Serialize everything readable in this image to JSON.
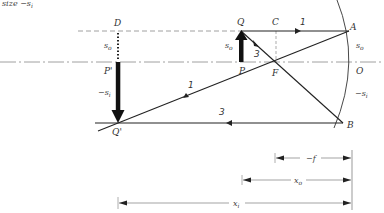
{
  "caption_fragment": "size  −s",
  "caption_subscript": "i",
  "points": {
    "D": "D",
    "Q": "Q",
    "C": "C",
    "A": "A",
    "P": "P",
    "F": "F",
    "O": "O",
    "P_prime": "P'",
    "Q_prime": "Q'",
    "B": "B"
  },
  "distances": {
    "s_o_left": "s",
    "s_o_left_sub": "o",
    "neg_s_i_left": "−s",
    "neg_s_i_left_sub": "i",
    "s_o_obj": "s",
    "s_o_obj_sub": "o",
    "s_o_right": "s",
    "s_o_right_sub": "o",
    "neg_s_i_right": "−s",
    "neg_s_i_right_sub": "i"
  },
  "rays": {
    "ray1_top": "1",
    "ray1_bottom": "1",
    "ray3_mid": "3",
    "ray3_bottom": "3"
  },
  "dimensions": {
    "neg_f": "−f",
    "x_o": "x",
    "x_o_sub": "o",
    "x_i": "x",
    "x_i_sub": "i"
  },
  "colors": {
    "line": "#222222",
    "axis": "#777777",
    "dashed": "#888888"
  }
}
